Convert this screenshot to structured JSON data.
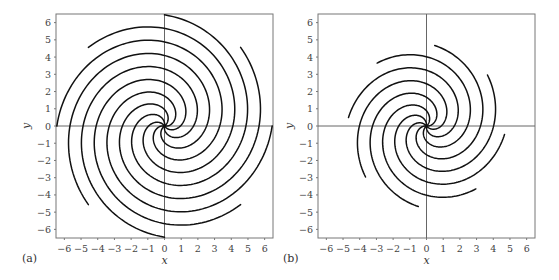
{
  "chart_data": [
    {
      "type": "line",
      "panel_label": "(a)",
      "title": "",
      "xlabel": "x",
      "ylabel": "y",
      "xlim": [
        -6.5,
        6.5
      ],
      "ylim": [
        -6.5,
        6.5
      ],
      "xticks": [
        -6,
        -5,
        -4,
        -3,
        -2,
        -1,
        0,
        1,
        2,
        3,
        4,
        5,
        6
      ],
      "yticks": [
        -6,
        -5,
        -4,
        -3,
        -2,
        -1,
        0,
        1,
        2,
        3,
        4,
        5,
        6
      ],
      "grid": false,
      "description": "Phase portrait: 8 spiral trajectories emanating from origin, r ≈ θ (counterclockwise outward), ending near r ≈ 6.4",
      "spiral": {
        "arms": 8,
        "k": 1.0,
        "r_max": 6.45,
        "phase_deg": 0
      },
      "arm_endpoints": [
        [
          6.3,
          0
        ],
        [
          4.5,
          4.5
        ],
        [
          0,
          6.3
        ],
        [
          -4.5,
          4.5
        ],
        [
          -6.3,
          0
        ],
        [
          -4.5,
          -4.5
        ],
        [
          0,
          -6.3
        ],
        [
          4.5,
          -4.5
        ]
      ]
    },
    {
      "type": "line",
      "panel_label": "(b)",
      "title": "",
      "xlabel": "x",
      "ylabel": "y",
      "xlim": [
        -6.5,
        6.5
      ],
      "ylim": [
        -6.5,
        6.5
      ],
      "xticks": [
        -6,
        -5,
        -4,
        -3,
        -2,
        -1,
        0,
        1,
        2,
        3,
        4,
        5,
        6
      ],
      "yticks": [
        -6,
        -5,
        -4,
        -3,
        -2,
        -1,
        0,
        1,
        2,
        3,
        4,
        5,
        6
      ],
      "grid": false,
      "description": "Phase portrait: 8 spiral trajectories emanating from origin, r ≈ θ (counterclockwise outward), ending near r ≈ 4.7",
      "spiral": {
        "arms": 8,
        "k": 1.0,
        "r_max": 4.7,
        "phase_deg": -6
      },
      "arm_endpoints": [
        [
          4.6,
          -0.5
        ],
        [
          3.6,
          2.9
        ],
        [
          0.5,
          4.6
        ],
        [
          -2.9,
          3.6
        ],
        [
          -4.6,
          0.5
        ],
        [
          -3.6,
          -2.9
        ],
        [
          0.5,
          -4.8
        ],
        [
          2.9,
          -3.6
        ]
      ]
    }
  ],
  "panels": [
    {
      "label": "(a)",
      "xlabel": "x",
      "ylabel": "y"
    },
    {
      "label": "(b)",
      "xlabel": "x",
      "ylabel": "y"
    }
  ],
  "colors": {
    "curve": "#111111",
    "axis": "#666666",
    "frame": "#777777"
  }
}
